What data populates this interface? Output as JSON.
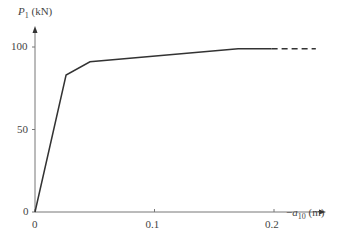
{
  "chart_data": {
    "type": "line",
    "title": "",
    "ylabel": "P1 (kN)",
    "ylabel_parts": {
      "var": "P",
      "sub": "1",
      "unit": "(kN)"
    },
    "xlabel": "-a10 (m)",
    "xlabel_parts": {
      "prefix": "−",
      "var": "a",
      "sub": "10",
      "unit": "(m)"
    },
    "xlim": [
      0,
      0.24
    ],
    "ylim": [
      0,
      110
    ],
    "x_ticks": [
      0,
      0.1,
      0.2
    ],
    "x_tick_labels": [
      "0",
      "0.1",
      "0.2"
    ],
    "y_ticks": [
      0,
      50,
      100
    ],
    "y_tick_labels": [
      "0",
      "50",
      "100"
    ],
    "grid": false,
    "series": [
      {
        "name": "solid",
        "style": "solid",
        "x": [
          0,
          0.026,
          0.046,
          0.17,
          0.198
        ],
        "y": [
          0,
          83,
          91,
          99,
          99
        ]
      },
      {
        "name": "extrapolated",
        "style": "dashed",
        "x": [
          0.198,
          0.235
        ],
        "y": [
          99,
          99
        ]
      }
    ]
  }
}
